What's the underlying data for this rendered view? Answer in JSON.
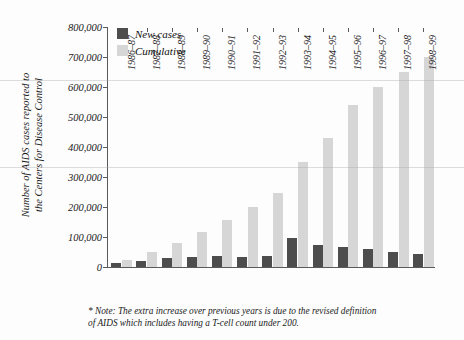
{
  "chart_data": {
    "type": "bar",
    "title": "",
    "subtitle": "",
    "xlabel": "",
    "ylabel": "Number of AIDS cases reported to the Centers for Disease Control",
    "ylabel_lines": [
      "Number of AIDS cases reported to",
      "the Centers for Disease Control"
    ],
    "ylim": [
      0,
      800000
    ],
    "ytick_labels": [
      "0",
      "100,000",
      "200,000",
      "300,000",
      "400,000",
      "500,000",
      "600,000",
      "700,000",
      "800,000"
    ],
    "ytick_values": [
      0,
      100000,
      200000,
      300000,
      400000,
      500000,
      600000,
      700000,
      800000
    ],
    "grid": false,
    "legend_position": "top-left",
    "categories": [
      "1986–87",
      "1987–88",
      "1988–89",
      "1989–90",
      "1990–91",
      "1991–92",
      "1992–93",
      "1993–94",
      "1994–95",
      "1995–96",
      "1996–97",
      "1997–98",
      "1998–99"
    ],
    "series": [
      {
        "name": "New cases",
        "color": "#4d4d4d",
        "values": [
          13000,
          20000,
          30000,
          34000,
          36000,
          35000,
          36000,
          97000,
          73000,
          68000,
          60000,
          50000,
          42000
        ]
      },
      {
        "name": "Cumulative",
        "color": "#d6d6d6",
        "values": [
          25000,
          50000,
          80000,
          118000,
          158000,
          200000,
          248000,
          350000,
          430000,
          540000,
          600000,
          650000,
          700000
        ]
      }
    ],
    "annotations": [
      "* Note: The extra increase over previous years is due to the revised definition of AIDS which includes having a T-cell count under 200."
    ]
  },
  "legend": {
    "items": [
      {
        "label": "New cases",
        "color": "#4d4d4d"
      },
      {
        "label": "Cumulative",
        "color": "#d6d6d6"
      }
    ]
  },
  "footnote": {
    "line1": "* Note: The extra increase over previous years is due to the revised definition",
    "line2": "of AIDS which includes having a T-cell count under 200."
  }
}
